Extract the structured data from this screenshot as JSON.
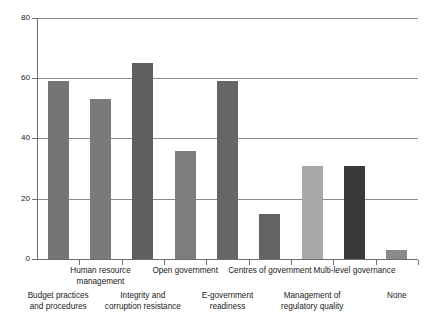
{
  "chart_data": {
    "type": "bar",
    "title": "",
    "subtitle": "",
    "xlabel": "",
    "ylabel": "",
    "ylim": [
      0,
      80
    ],
    "yticks": [
      0,
      20,
      40,
      60,
      80
    ],
    "ytick_labels": [
      "0",
      "20",
      "40",
      "60",
      "80"
    ],
    "grid": "horizontal",
    "legend": "none",
    "categories": [
      "Budget practices and procedures",
      "Human resource management",
      "Integrity and corruption resistance",
      "Open government",
      "E-government readiness",
      "Centres of government",
      "Management of regulatory quality",
      "Multi-level governance",
      "None"
    ],
    "category_lines": [
      [
        "Budget practices",
        "and procedures"
      ],
      [
        "Human resource",
        "management"
      ],
      [
        "Integrity and",
        "corruption resistance"
      ],
      [
        "Open government"
      ],
      [
        "E-government",
        "readiness"
      ],
      [
        "Centres of government"
      ],
      [
        "Management of",
        "regulatory quality"
      ],
      [
        "Multi-level governance"
      ],
      [
        "None"
      ]
    ],
    "category_label_row": [
      "bottom",
      "top",
      "bottom",
      "top",
      "bottom",
      "top",
      "bottom",
      "top",
      "bottom"
    ],
    "values": [
      59,
      53,
      65,
      36,
      59,
      15,
      31,
      31,
      3
    ],
    "bar_colors": [
      "#757575",
      "#7a7a7a",
      "#5f5f5f",
      "#7d7d7d",
      "#666666",
      "#636363",
      "#a8a8a8",
      "#3a3a3a",
      "#8a8a8a"
    ],
    "axis_color": "#6e6e6e",
    "grid_color": "#8c8c8c"
  }
}
